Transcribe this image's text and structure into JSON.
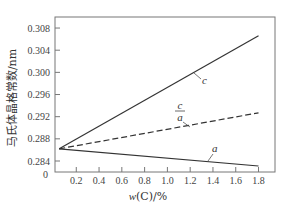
{
  "chart_data": {
    "type": "line",
    "title": "",
    "xlabel": "w(C)/%",
    "ylabel": "马氏体晶格常数/nm",
    "xlim": [
      0,
      2.0
    ],
    "ylim": [
      0.282,
      0.31
    ],
    "y_axis_break": true,
    "x_ticks": [
      "0.2",
      "0.4",
      "0.6",
      "0.8",
      "1.0",
      "1.2",
      "1.4",
      "1.6",
      "1.8"
    ],
    "x_tick_values": [
      0.2,
      0.4,
      0.6,
      0.8,
      1.0,
      1.2,
      1.4,
      1.6,
      1.8
    ],
    "y_ticks": [
      "0.308",
      "0.304",
      "0.300",
      "0.296",
      "0.292",
      "0.288",
      "0.284",
      "0"
    ],
    "y_tick_values": [
      0.308,
      0.304,
      0.3,
      0.296,
      0.292,
      0.288,
      0.284
    ],
    "origin_label": "0",
    "grid": false,
    "legend": "inline labels",
    "series": [
      {
        "name": "c",
        "label": "c",
        "style": "solid",
        "x": [
          0.05,
          1.8
        ],
        "values": [
          0.2862,
          0.3066
        ]
      },
      {
        "name": "c/a",
        "label_num": "c",
        "label_den": "a",
        "style": "dashed",
        "x": [
          0.05,
          1.8
        ],
        "values": [
          0.2862,
          0.2927
        ]
      },
      {
        "name": "a",
        "label": "a",
        "style": "solid",
        "x": [
          0.05,
          1.8
        ],
        "values": [
          0.2862,
          0.2831
        ]
      }
    ]
  },
  "labels": {
    "x_title": "w(C)/%",
    "y_title": "马氏体晶格常数/nm",
    "origin": "0",
    "series_c": "c",
    "series_ca_num": "c",
    "series_ca_den": "a",
    "series_a": "a"
  }
}
